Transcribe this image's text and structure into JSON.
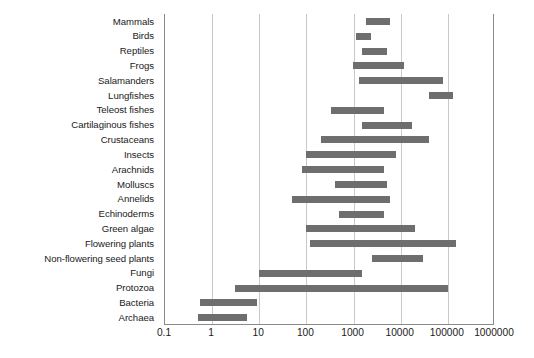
{
  "chart_data": {
    "type": "bar",
    "orientation": "horizontal-range",
    "title": "",
    "subtitle": "",
    "xlabel": "",
    "ylabel": "",
    "xscale": "log",
    "xlim": [
      0.1,
      1000000
    ],
    "xticks": [
      0.1,
      1,
      10,
      100,
      1000,
      10000,
      100000,
      1000000
    ],
    "xtick_labels": [
      "0.1",
      "1",
      "10",
      "100",
      "1000",
      "10000",
      "100000",
      "1000000"
    ],
    "grid": "vertical",
    "legend": "none",
    "bar_color": "#6e6e6e",
    "categories": [
      "Mammals",
      "Birds",
      "Reptiles",
      "Frogs",
      "Salamanders",
      "Lungfishes",
      "Teleost fishes",
      "Cartilaginous fishes",
      "Crustaceans",
      "Insects",
      "Arachnids",
      "Molluscs",
      "Annelids",
      "Echinoderms",
      "Green algae",
      "Flowering plants",
      "Non-flowering seed plants",
      "Fungi",
      "Protozoa",
      "Bacteria",
      "Archaea"
    ],
    "ranges": [
      {
        "category": "Mammals",
        "low": 1800,
        "high": 6000
      },
      {
        "category": "Birds",
        "low": 1100,
        "high": 2300
      },
      {
        "category": "Reptiles",
        "low": 1500,
        "high": 5000
      },
      {
        "category": "Frogs",
        "low": 950,
        "high": 12000
      },
      {
        "category": "Salamanders",
        "low": 1300,
        "high": 80000
      },
      {
        "category": "Lungfishes",
        "low": 40000,
        "high": 130000
      },
      {
        "category": "Teleost fishes",
        "low": 340,
        "high": 4500
      },
      {
        "category": "Cartilaginous fishes",
        "low": 1500,
        "high": 17000
      },
      {
        "category": "Crustaceans",
        "low": 200,
        "high": 40000
      },
      {
        "category": "Insects",
        "low": 100,
        "high": 8000
      },
      {
        "category": "Arachnids",
        "low": 80,
        "high": 4500
      },
      {
        "category": "Molluscs",
        "low": 400,
        "high": 5000
      },
      {
        "category": "Annelids",
        "low": 50,
        "high": 6000
      },
      {
        "category": "Echinoderms",
        "low": 500,
        "high": 4500
      },
      {
        "category": "Green algae",
        "low": 100,
        "high": 20000
      },
      {
        "category": "Flowering plants",
        "low": 120,
        "high": 150000
      },
      {
        "category": "Non-flowering seed plants",
        "low": 2500,
        "high": 30000
      },
      {
        "category": "Fungi",
        "low": 10,
        "high": 1500
      },
      {
        "category": "Protozoa",
        "low": 3,
        "high": 100000
      },
      {
        "category": "Bacteria",
        "low": 0.55,
        "high": 9
      },
      {
        "category": "Archaea",
        "low": 0.5,
        "high": 5.5
      }
    ]
  }
}
